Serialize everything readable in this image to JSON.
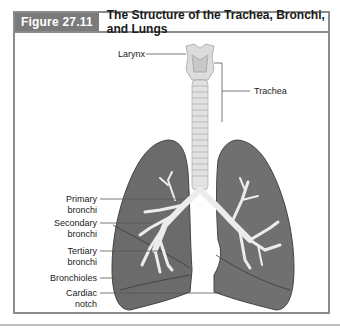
{
  "figure": {
    "number": "Figure 27.11",
    "title": "The Structure of the Trachea, Bronchi, and Lungs"
  },
  "labels": {
    "larynx": "Larynx",
    "trachea": "Trachea",
    "primary_bronchi_1": "Primary",
    "primary_bronchi_2": "bronchi",
    "secondary_bronchi_1": "Secondary",
    "secondary_bronchi_2": "bronchi",
    "tertiary_bronchi_1": "Tertiary",
    "tertiary_bronchi_2": "bronchi",
    "bronchioles": "Bronchioles",
    "cardiac_notch_1": "Cardiac",
    "cardiac_notch_2": "notch"
  },
  "colors": {
    "header_bg": "#7a7a7a",
    "border": "#8c8c8c",
    "lung_fill": "#6b6b6b",
    "airway_fill": "#e6e6e6",
    "leader_line": "#555555"
  }
}
